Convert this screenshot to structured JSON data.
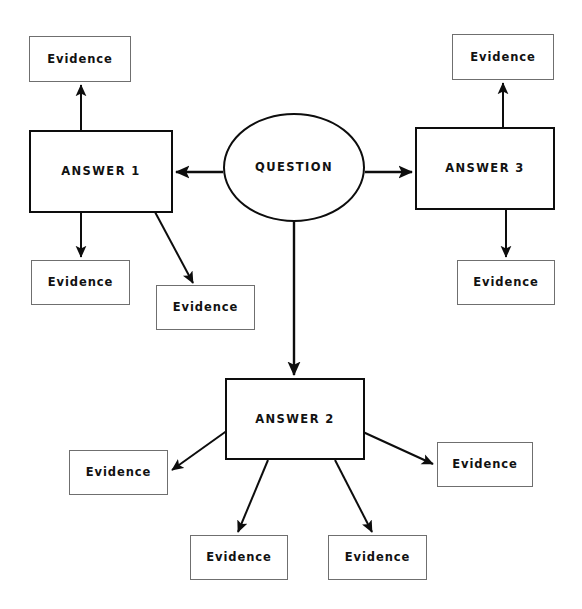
{
  "diagram": {
    "type": "node-link-diagram",
    "canvas": {
      "width": 582,
      "height": 609,
      "background": "#ffffff"
    },
    "colors": {
      "background": "#ffffff",
      "evidence_border": "#6f6f6f",
      "answer_border": "#0d0d0d",
      "question_border": "#0d0d0d",
      "edge": "#0d0d0d",
      "text": "#121212"
    },
    "nodes": [
      {
        "id": "question",
        "label": "QUESTION",
        "shape": "ellipse",
        "x": 223,
        "y": 113,
        "w": 142,
        "h": 109,
        "style": "question"
      },
      {
        "id": "answer1",
        "label": "ANSWER 1",
        "shape": "rect",
        "x": 29,
        "y": 130,
        "w": 144,
        "h": 83,
        "style": "answer"
      },
      {
        "id": "answer2",
        "label": "ANSWER 2",
        "shape": "rect",
        "x": 225,
        "y": 378,
        "w": 140,
        "h": 82,
        "style": "answer"
      },
      {
        "id": "answer3",
        "label": "ANSWER 3",
        "shape": "rect",
        "x": 415,
        "y": 127,
        "w": 140,
        "h": 83,
        "style": "answer"
      },
      {
        "id": "evidence_a1_top",
        "label": "Evidence",
        "shape": "rect",
        "x": 29,
        "y": 36,
        "w": 102,
        "h": 46,
        "style": "evidence"
      },
      {
        "id": "evidence_a1_down",
        "label": "Evidence",
        "shape": "rect",
        "x": 31,
        "y": 260,
        "w": 99,
        "h": 45,
        "style": "evidence"
      },
      {
        "id": "evidence_a1_diag",
        "label": "Evidence",
        "shape": "rect",
        "x": 156,
        "y": 285,
        "w": 99,
        "h": 45,
        "style": "evidence"
      },
      {
        "id": "evidence_a3_top",
        "label": "Evidence",
        "shape": "rect",
        "x": 452,
        "y": 34,
        "w": 102,
        "h": 46,
        "style": "evidence"
      },
      {
        "id": "evidence_a3_down",
        "label": "Evidence",
        "shape": "rect",
        "x": 457,
        "y": 260,
        "w": 98,
        "h": 45,
        "style": "evidence"
      },
      {
        "id": "evidence_a2_left",
        "label": "Evidence",
        "shape": "rect",
        "x": 69,
        "y": 450,
        "w": 99,
        "h": 45,
        "style": "evidence"
      },
      {
        "id": "evidence_a2_right",
        "label": "Evidence",
        "shape": "rect",
        "x": 437,
        "y": 442,
        "w": 96,
        "h": 45,
        "style": "evidence"
      },
      {
        "id": "evidence_a2_bottomleft",
        "label": "Evidence",
        "shape": "rect",
        "x": 190,
        "y": 535,
        "w": 98,
        "h": 45,
        "style": "evidence"
      },
      {
        "id": "evidence_a2_bottomright",
        "label": "Evidence",
        "shape": "rect",
        "x": 328,
        "y": 535,
        "w": 99,
        "h": 45,
        "style": "evidence"
      }
    ],
    "edges": [
      {
        "id": "q-to-a1",
        "from": "question",
        "to": "answer1",
        "x1": 223,
        "y1": 172,
        "x2": 176,
        "y2": 172,
        "width": 2.4,
        "arrow": "end"
      },
      {
        "id": "q-to-a3",
        "from": "question",
        "to": "answer3",
        "x1": 365,
        "y1": 172,
        "x2": 412,
        "y2": 172,
        "width": 2.4,
        "arrow": "end"
      },
      {
        "id": "q-to-a2",
        "from": "question",
        "to": "answer2",
        "x1": 294,
        "y1": 221,
        "x2": 294,
        "y2": 375,
        "width": 2.4,
        "arrow": "end"
      },
      {
        "id": "a1-to-ev-top",
        "from": "answer1",
        "to": "evidence_a1_top",
        "x1": 81,
        "y1": 130,
        "x2": 81,
        "y2": 85,
        "width": 2.0,
        "arrow": "end"
      },
      {
        "id": "a1-to-ev-down",
        "from": "answer1",
        "to": "evidence_a1_down",
        "x1": 81,
        "y1": 213,
        "x2": 81,
        "y2": 257,
        "width": 2.0,
        "arrow": "end"
      },
      {
        "id": "a1-to-ev-diag",
        "from": "answer1",
        "to": "evidence_a1_diag",
        "x1": 155,
        "y1": 212,
        "x2": 193,
        "y2": 283,
        "width": 2.0,
        "arrow": "end"
      },
      {
        "id": "a3-to-ev-top",
        "from": "answer3",
        "to": "evidence_a3_top",
        "x1": 503,
        "y1": 127,
        "x2": 503,
        "y2": 83,
        "width": 2.0,
        "arrow": "end"
      },
      {
        "id": "a3-to-ev-down",
        "from": "answer3",
        "to": "evidence_a3_down",
        "x1": 506,
        "y1": 210,
        "x2": 506,
        "y2": 257,
        "width": 2.0,
        "arrow": "end"
      },
      {
        "id": "a2-to-ev-left",
        "from": "answer2",
        "to": "evidence_a2_left",
        "x1": 228,
        "y1": 430,
        "x2": 172,
        "y2": 470,
        "width": 2.0,
        "arrow": "end"
      },
      {
        "id": "a2-to-ev-right",
        "from": "answer2",
        "to": "evidence_a2_right",
        "x1": 363,
        "y1": 432,
        "x2": 433,
        "y2": 464,
        "width": 2.0,
        "arrow": "end"
      },
      {
        "id": "a2-to-ev-bottomleft",
        "from": "answer2",
        "to": "evidence_a2_bottomleft",
        "x1": 268,
        "y1": 460,
        "x2": 238,
        "y2": 532,
        "width": 2.0,
        "arrow": "end"
      },
      {
        "id": "a2-to-ev-bottomright",
        "from": "answer2",
        "to": "evidence_a2_bottomright",
        "x1": 335,
        "y1": 460,
        "x2": 372,
        "y2": 532,
        "width": 2.0,
        "arrow": "end"
      }
    ]
  }
}
